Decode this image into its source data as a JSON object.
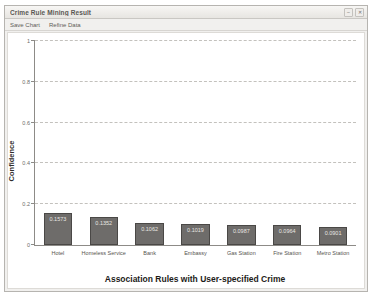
{
  "window": {
    "title": "Crime Rule Mining Result",
    "controls": [
      {
        "name": "minimize-button",
        "glyph": "–"
      },
      {
        "name": "close-button",
        "glyph": "✕"
      }
    ]
  },
  "menu": {
    "items": [
      {
        "name": "menu-save-chart",
        "label": "Save Chart"
      },
      {
        "name": "menu-refine-data",
        "label": "Refine Data"
      }
    ]
  },
  "chart_data": {
    "type": "bar",
    "title": "",
    "xlabel": "Association Rules with User-specified Crime",
    "ylabel": "Confidence",
    "ylim": [
      0,
      1
    ],
    "yticks": [
      "0",
      "0.2",
      "0.4",
      "0.6",
      "0.8",
      "1"
    ],
    "grid": true,
    "legend": "none",
    "bar_color": "#6e6c6a",
    "bar_border_color": "#4a4846",
    "categories": [
      "Hotel",
      "Homeless Service",
      "Bank",
      "Embassy",
      "Gas Station",
      "Fire Station",
      "Metro Station"
    ],
    "values": [
      0.1573,
      0.1352,
      0.1062,
      0.1019,
      0.0987,
      0.0964,
      0.0901
    ],
    "value_labels": [
      "0.1573",
      "0.1352",
      "0.1062",
      "0.1019",
      "0.0987",
      "0.0964",
      "0.0901"
    ]
  }
}
